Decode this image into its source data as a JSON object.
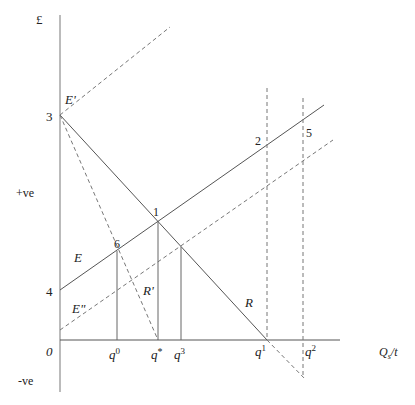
{
  "figure": {
    "y_axis_unit": "£",
    "x_axis_label_main": "Q",
    "x_axis_label_sub": "s",
    "x_axis_label_tail": "/t",
    "origin_label": "0",
    "positive_label": "+ve",
    "negative_label": "-ve",
    "point_labels": {
      "p1": "1",
      "p2": "2",
      "p3": "3",
      "p4": "4",
      "p5": "5",
      "p6": "6"
    },
    "curve_labels": {
      "E": "E",
      "E_prime": "E'",
      "E_double_prime": "E\"",
      "R": "R",
      "R_prime": "R'"
    },
    "quantity_labels": {
      "q0": "q",
      "q0_sup": "0",
      "qstar": "q",
      "qstar_sup": "*",
      "q3": "q",
      "q3_sup": "3",
      "q1": "q",
      "q1_sup": "1",
      "q2": "q",
      "q2_sup": "2"
    }
  },
  "colors": {
    "axis": "#aaaaaa",
    "line": "#555555",
    "dashed": "#777777",
    "text": "#222222"
  }
}
